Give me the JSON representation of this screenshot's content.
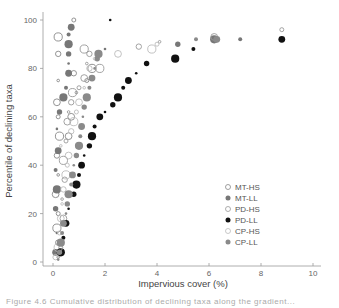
{
  "chart_data": {
    "type": "scatter",
    "title": "",
    "xlabel": "Impervious cover (%)",
    "ylabel": "Percentile of declining taxa",
    "xlim": [
      0,
      10
    ],
    "ylim": [
      0,
      100
    ],
    "xticks": [
      0,
      2,
      4,
      6,
      8,
      10
    ],
    "yticks": [
      0,
      20,
      40,
      60,
      80,
      100
    ],
    "grid": false,
    "legend_position": "right-center",
    "legend": [
      {
        "name": "MT-HS",
        "marker": "open-circle",
        "color": "#888888"
      },
      {
        "name": "MT-LL",
        "marker": "filled-circle",
        "color": "#777777"
      },
      {
        "name": "PD-HS",
        "marker": "open-circle",
        "color": "#999999"
      },
      {
        "name": "PD-LL",
        "marker": "filled-circle",
        "color": "#111111"
      },
      {
        "name": "CP-HS",
        "marker": "open-circle",
        "color": "#bbbbbb"
      },
      {
        "name": "CP-LL",
        "marker": "filled-circle",
        "color": "#8a8a8a"
      }
    ],
    "series": [
      {
        "name": "MT-HS",
        "points": [
          [
            0.2,
            2
          ],
          [
            0.2,
            8
          ],
          [
            0.15,
            14
          ],
          [
            0.2,
            20
          ],
          [
            0.1,
            28
          ],
          [
            0.2,
            36
          ],
          [
            0.15,
            44
          ],
          [
            0.25,
            52
          ],
          [
            0.2,
            60
          ],
          [
            0.15,
            66
          ],
          [
            0.2,
            75
          ],
          [
            0.2,
            86
          ],
          [
            0.2,
            93
          ],
          [
            0.8,
            100
          ],
          [
            0.7,
            60
          ],
          [
            0.9,
            70
          ],
          [
            0.8,
            78
          ],
          [
            1.5,
            80
          ],
          [
            1.3,
            75
          ],
          [
            0.6,
            52
          ]
        ]
      },
      {
        "name": "MT-LL",
        "points": [
          [
            0.1,
            4
          ],
          [
            0.15,
            12
          ],
          [
            0.1,
            22
          ],
          [
            0.15,
            30
          ],
          [
            0.1,
            38
          ],
          [
            0.2,
            46
          ],
          [
            0.15,
            55
          ],
          [
            0.25,
            62
          ],
          [
            0.4,
            68
          ],
          [
            0.5,
            72
          ],
          [
            0.6,
            78
          ],
          [
            0.6,
            82
          ],
          [
            0.6,
            86
          ],
          [
            0.6,
            90
          ],
          [
            0.6,
            94
          ],
          [
            0.7,
            97
          ],
          [
            2.0,
            88
          ],
          [
            4.8,
            90
          ],
          [
            6.2,
            92
          ],
          [
            7.2,
            92
          ]
        ]
      },
      {
        "name": "PD-HS",
        "points": [
          [
            0.3,
            6
          ],
          [
            0.4,
            18
          ],
          [
            0.35,
            26
          ],
          [
            0.45,
            34
          ],
          [
            0.4,
            42
          ],
          [
            0.5,
            50
          ],
          [
            0.55,
            58
          ],
          [
            0.6,
            62
          ],
          [
            0.7,
            66
          ],
          [
            0.75,
            70
          ],
          [
            1.0,
            72
          ],
          [
            1.2,
            76
          ],
          [
            1.3,
            82
          ],
          [
            1.4,
            86
          ],
          [
            1.2,
            88
          ],
          [
            8.8,
            96
          ],
          [
            6.2,
            93
          ],
          [
            4.1,
            91
          ],
          [
            3.3,
            89
          ],
          [
            1.8,
            80
          ]
        ]
      },
      {
        "name": "PD-LL",
        "points": [
          [
            0.3,
            4
          ],
          [
            0.4,
            10
          ],
          [
            0.5,
            16
          ],
          [
            0.6,
            22
          ],
          [
            0.8,
            28
          ],
          [
            0.9,
            32
          ],
          [
            1.0,
            36
          ],
          [
            1.1,
            40
          ],
          [
            1.2,
            44
          ],
          [
            1.4,
            48
          ],
          [
            1.5,
            52
          ],
          [
            1.6,
            56
          ],
          [
            1.8,
            60
          ],
          [
            2.0,
            62
          ],
          [
            2.3,
            65
          ],
          [
            2.5,
            68
          ],
          [
            2.7,
            72
          ],
          [
            2.9,
            75
          ],
          [
            3.2,
            78
          ],
          [
            3.6,
            82
          ],
          [
            4.7,
            84
          ],
          [
            5.4,
            88
          ],
          [
            8.8,
            92
          ],
          [
            2.2,
            100
          ]
        ]
      },
      {
        "name": "CP-HS",
        "points": [
          [
            0.1,
            2
          ],
          [
            0.2,
            6
          ],
          [
            0.25,
            12
          ],
          [
            0.3,
            18
          ],
          [
            0.35,
            24
          ],
          [
            0.4,
            30
          ],
          [
            0.5,
            36
          ],
          [
            0.55,
            40
          ],
          [
            0.6,
            44
          ],
          [
            0.3,
            48
          ],
          [
            0.7,
            54
          ],
          [
            0.8,
            58
          ],
          [
            0.9,
            62
          ],
          [
            1.0,
            66
          ],
          [
            1.2,
            72
          ],
          [
            1.4,
            80
          ],
          [
            3.8,
            88
          ],
          [
            4.0,
            90
          ],
          [
            2.5,
            86
          ],
          [
            1.6,
            84
          ]
        ]
      },
      {
        "name": "CP-LL",
        "points": [
          [
            0.2,
            1
          ],
          [
            0.25,
            4
          ],
          [
            0.3,
            8
          ],
          [
            0.35,
            12
          ],
          [
            0.4,
            16
          ],
          [
            0.5,
            20
          ],
          [
            0.55,
            24
          ],
          [
            0.6,
            28
          ],
          [
            0.7,
            32
          ],
          [
            0.75,
            36
          ],
          [
            0.8,
            40
          ],
          [
            0.9,
            44
          ],
          [
            1.0,
            48
          ],
          [
            1.05,
            52
          ],
          [
            1.1,
            56
          ],
          [
            1.15,
            60
          ],
          [
            1.2,
            64
          ],
          [
            1.3,
            68
          ],
          [
            1.4,
            72
          ],
          [
            1.5,
            76
          ],
          [
            1.6,
            80
          ],
          [
            1.7,
            84
          ],
          [
            1.75,
            86
          ],
          [
            5.5,
            92
          ],
          [
            6.3,
            92
          ]
        ]
      }
    ]
  },
  "caption": "Figure 4.6   Cumulative distribution of declining taxa along the gradient..."
}
